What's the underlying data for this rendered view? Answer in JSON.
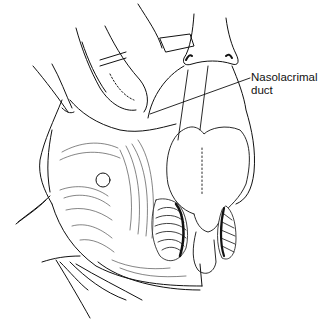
{
  "figure": {
    "type": "surgical line illustration",
    "palette": {
      "ink": "#111111",
      "background": "#ffffff"
    },
    "labels": [
      {
        "line1": "Nasolacrimal",
        "line2": "duct",
        "text": "Nasolacrimal duct"
      }
    ]
  }
}
